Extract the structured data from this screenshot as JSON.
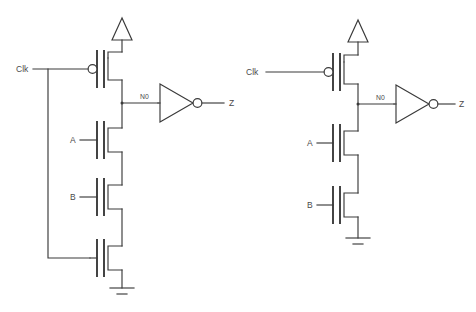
{
  "page": {
    "background_color": "#ffffff",
    "line_color": "#3a3a3a",
    "text_color": "#4a4a4a"
  },
  "circuits": [
    {
      "id": "left",
      "name": "footed-dynamic-gate",
      "labels": {
        "clk": "Clk",
        "a": "A",
        "b": "B",
        "node": "N0",
        "out": "Z"
      },
      "devices": [
        {
          "name": "pmos-precharge",
          "type": "pmos",
          "gate": "Clk"
        },
        {
          "name": "nmos-a",
          "type": "nmos",
          "gate": "A"
        },
        {
          "name": "nmos-b",
          "type": "nmos",
          "gate": "B"
        },
        {
          "name": "nmos-footer",
          "type": "nmos",
          "gate": "Clk"
        }
      ],
      "supplies": {
        "vdd": "vdd-arrow",
        "gnd": "ground-symbol"
      },
      "inverter": {
        "name": "output-inverter",
        "input": "N0",
        "output": "Z"
      }
    },
    {
      "id": "right",
      "name": "footless-dynamic-gate",
      "labels": {
        "clk": "Clk",
        "a": "A",
        "b": "B",
        "node": "N0",
        "out": "Z"
      },
      "devices": [
        {
          "name": "pmos-precharge",
          "type": "pmos",
          "gate": "Clk"
        },
        {
          "name": "nmos-a",
          "type": "nmos",
          "gate": "A"
        },
        {
          "name": "nmos-b",
          "type": "nmos",
          "gate": "B"
        }
      ],
      "supplies": {
        "vdd": "vdd-arrow",
        "gnd": "ground-symbol"
      },
      "inverter": {
        "name": "output-inverter",
        "input": "N0",
        "output": "Z"
      }
    }
  ]
}
